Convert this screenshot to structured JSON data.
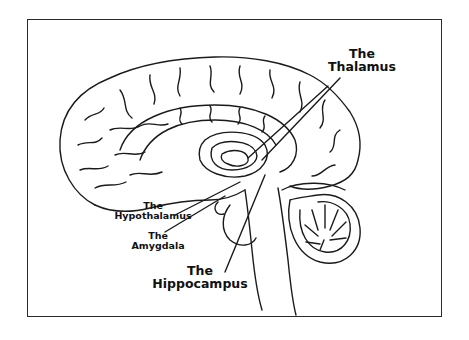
{
  "diagram": {
    "style": "line-drawing",
    "colors": {
      "line": "#1a1a1a",
      "background": "#ffffff",
      "frame": "#2a2a2a"
    },
    "labels": [
      {
        "id": "thalamus",
        "line1": "The",
        "line2": "Thalamus"
      },
      {
        "id": "hypothalamus",
        "line1": "The",
        "line2": "Hypothalamus"
      },
      {
        "id": "amygdala",
        "line1": "The",
        "line2": "Amygdala"
      },
      {
        "id": "hippocampus",
        "line1": "The",
        "line2": "Hippocampus"
      }
    ]
  }
}
